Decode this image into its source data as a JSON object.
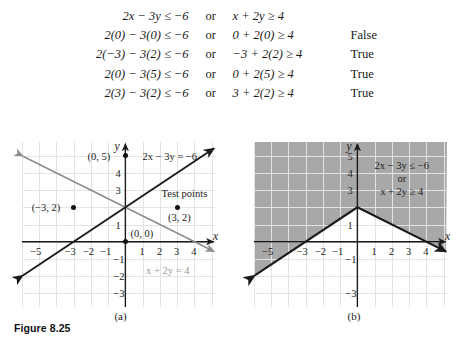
{
  "derivation": {
    "rows": [
      {
        "left": "2x − 3y ≤ −6",
        "connector": "or",
        "right": "x + 2y ≥ 4",
        "result": ""
      },
      {
        "left": "2(0) − 3(0) ≤ −6",
        "connector": "or",
        "right": "0 + 2(0) ≥ 4",
        "result": "False"
      },
      {
        "left": "2(−3) − 3(2) ≤ −6",
        "connector": "or",
        "right": "−3 + 2(2) ≥ 4",
        "result": "True"
      },
      {
        "left": "2(0) − 3(5) ≤ −6",
        "connector": "or",
        "right": "0 + 2(5) ≥ 4",
        "result": "True"
      },
      {
        "left": "2(3) − 3(2) ≤ −6",
        "connector": "or",
        "right": "3 + 2(2) ≥ 4",
        "result": "True"
      }
    ]
  },
  "figure": {
    "caption": "Figure 8.25",
    "panel_a_label": "(a)",
    "panel_b_label": "(b)"
  },
  "panel_a": {
    "x_axis_label": "x",
    "y_axis_label": "y",
    "x_ticks": [
      "−5",
      "−3",
      "−2",
      "−1",
      "1",
      "2",
      "3",
      "4"
    ],
    "y_ticks": [
      "4",
      "3",
      "1",
      "−1",
      "−2",
      "−3"
    ],
    "line1_label": "2x − 3y = −6",
    "line2_label": "x + 2y = 4",
    "test_points_label": "Test points",
    "points": [
      {
        "label": "(0, 5)",
        "x": 0,
        "y": 5
      },
      {
        "label": "(−3, 2)",
        "x": -3,
        "y": 2
      },
      {
        "label": "(0, 0)",
        "x": 0,
        "y": 0
      },
      {
        "label": "(3, 2)",
        "x": 3,
        "y": 2
      }
    ]
  },
  "panel_b": {
    "x_axis_label": "x",
    "y_axis_label": "y",
    "x_ticks": [
      "−5",
      "−3",
      "−2",
      "−1",
      "1",
      "2",
      "3",
      "4"
    ],
    "y_ticks": [
      "5",
      "4",
      "3",
      "1",
      "−1",
      "−3"
    ],
    "region_line1": "2x − 3y ≤ −6",
    "region_connector": "or",
    "region_line2": "x + 2y ≥ 4",
    "shade_color": "#a8a8a8"
  },
  "chart_data": [
    {
      "type": "line",
      "panel": "(a)",
      "title": "",
      "xlabel": "x",
      "ylabel": "y",
      "xlim": [
        -6.0,
        5.2
      ],
      "ylim": [
        -3.8,
        5.8
      ],
      "grid": true,
      "xticks": [
        -5,
        -3,
        -2,
        -1,
        1,
        2,
        3,
        4
      ],
      "yticks": [
        4,
        3,
        1,
        -1,
        -2,
        -3
      ],
      "series": [
        {
          "name": "2x − 3y = −6",
          "color": "#1a1a1a",
          "equation": "y = (2x + 6)/3",
          "points": [
            [
              -6.0,
              -2.0
            ],
            [
              5.2,
              5.47
            ]
          ],
          "style": "solid",
          "arrows": "both"
        },
        {
          "name": "x + 2y = 4",
          "color": "#8d8d8d",
          "equation": "y = (4 - x)/2",
          "points": [
            [
              -6.0,
              5.0
            ],
            [
              5.2,
              -0.6
            ]
          ],
          "style": "solid",
          "arrows": "both"
        }
      ],
      "annotations": [
        {
          "text": "(0, 5)",
          "x": 0,
          "y": 5,
          "marker": true
        },
        {
          "text": "(−3, 2)",
          "x": -3,
          "y": 2,
          "marker": true
        },
        {
          "text": "(0, 0)",
          "x": 0,
          "y": 0,
          "marker": true
        },
        {
          "text": "(3, 2)",
          "x": 3,
          "y": 2,
          "marker": true
        },
        {
          "text": "Test points",
          "x": 3,
          "y": 3,
          "marker": false
        },
        {
          "text": "2x − 3y = −6",
          "x": 2.2,
          "y": 5.2,
          "marker": false
        },
        {
          "text": "x + 2y = 4",
          "x": 2.4,
          "y": -1.5,
          "marker": false
        }
      ]
    },
    {
      "type": "area",
      "panel": "(b)",
      "title": "",
      "xlabel": "x",
      "ylabel": "y",
      "xlim": [
        -6.0,
        5.2
      ],
      "ylim": [
        -3.8,
        5.8
      ],
      "grid": true,
      "xticks": [
        -5,
        -3,
        -2,
        -1,
        1,
        2,
        3,
        4
      ],
      "yticks": [
        5,
        4,
        3,
        1,
        -1,
        -3
      ],
      "shaded_region": "union of (2x − 3y ≤ −6) and (x + 2y ≥ 4)",
      "shade_color": "#a8a8a8",
      "boundary_vertex": [
        0,
        2
      ],
      "series": [
        {
          "name": "2x − 3y = −6",
          "color": "#1a1a1a",
          "equation": "y = (2x + 6)/3",
          "points": [
            [
              -6.0,
              -2.0
            ],
            [
              0,
              2
            ]
          ],
          "style": "solid"
        },
        {
          "name": "x + 2y = 4",
          "color": "#1a1a1a",
          "equation": "y = (4 - x)/2",
          "points": [
            [
              0,
              2
            ],
            [
              5.2,
              -0.6
            ]
          ],
          "style": "solid"
        }
      ],
      "annotations": [
        {
          "text": "2x − 3y ≤ −6",
          "x": 2.4,
          "y": 4.2,
          "marker": false
        },
        {
          "text": "or",
          "x": 2.4,
          "y": 3.5,
          "marker": false
        },
        {
          "text": "x + 2y ≥ 4",
          "x": 2.4,
          "y": 2.9,
          "marker": false
        }
      ]
    }
  ]
}
